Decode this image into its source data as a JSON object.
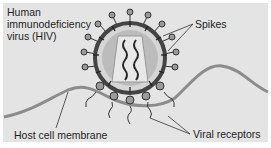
{
  "diagram": {
    "title_lines": [
      "Human",
      "immunodeficiency",
      "virus (HIV)"
    ],
    "labels": {
      "spikes": "Spikes",
      "host_membrane": "Host cell membrane",
      "viral_receptors": "Viral receptors"
    },
    "colors": {
      "background": "#e4e4e4",
      "membrane": "#8c8c8c",
      "envelope": "#444444",
      "capsid": "#c8c8c8",
      "rna": "#2a2a2a",
      "spike_knob": "#9a9a9a"
    }
  }
}
